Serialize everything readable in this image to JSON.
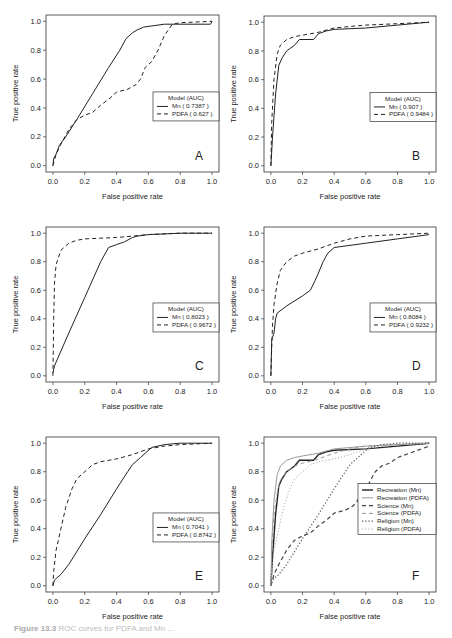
{
  "figure": {
    "caption_label": "Figure 13.3",
    "caption_text": "ROC curves for PDFA and Mn ..."
  },
  "chart_data": [
    {
      "panel": "A",
      "type": "line",
      "xlabel": "False positive rate",
      "ylabel": "True positive rate",
      "xlim": [
        0,
        1
      ],
      "ylim": [
        0,
        1
      ],
      "xticks": [
        "0.0",
        "0.2",
        "0.4",
        "0.6",
        "0.8",
        "1.0"
      ],
      "yticks": [
        "0.0",
        "0.2",
        "0.4",
        "0.6",
        "0.8",
        "1.0"
      ],
      "grid": false,
      "legend": {
        "title": "Model (AUC)",
        "position": "center-right",
        "entries": [
          "Mn ( 0.7387 )",
          "PDFA ( 0.627 )"
        ]
      },
      "series": [
        {
          "name": "Mn",
          "auc": 0.7387,
          "style": "solid",
          "x": [
            0,
            0.005,
            0.02,
            0.04,
            0.08,
            0.15,
            0.25,
            0.35,
            0.42,
            0.46,
            0.5,
            0.53,
            0.57,
            0.7,
            0.99,
            1.0
          ],
          "y": [
            0,
            0.05,
            0.08,
            0.14,
            0.2,
            0.32,
            0.5,
            0.68,
            0.8,
            0.88,
            0.92,
            0.94,
            0.96,
            0.98,
            0.98,
            1.0
          ]
        },
        {
          "name": "PDFA",
          "auc": 0.627,
          "style": "dashed",
          "x": [
            0,
            0.02,
            0.05,
            0.1,
            0.15,
            0.2,
            0.25,
            0.3,
            0.35,
            0.4,
            0.47,
            0.52,
            0.55,
            0.58,
            0.62,
            0.66,
            0.7,
            0.75,
            0.8,
            1.0
          ],
          "y": [
            0,
            0.08,
            0.15,
            0.25,
            0.32,
            0.35,
            0.37,
            0.42,
            0.46,
            0.51,
            0.53,
            0.56,
            0.6,
            0.68,
            0.72,
            0.8,
            0.9,
            0.98,
            0.99,
            1.0
          ]
        }
      ]
    },
    {
      "panel": "B",
      "type": "line",
      "xlabel": "False positive rate",
      "ylabel": "True positive rate",
      "xlim": [
        0,
        1
      ],
      "ylim": [
        0,
        1
      ],
      "xticks": [
        "0.0",
        "0.2",
        "0.4",
        "0.6",
        "0.8",
        "1.0"
      ],
      "yticks": [
        "0.0",
        "0.2",
        "0.4",
        "0.6",
        "0.8",
        "1.0"
      ],
      "grid": false,
      "legend": {
        "title": "Model (AUC)",
        "position": "center-right",
        "entries": [
          "Mn ( 0.907 )",
          "PDFA ( 0.9484 )"
        ]
      },
      "series": [
        {
          "name": "Mn",
          "auc": 0.907,
          "style": "solid",
          "x": [
            0,
            0.01,
            0.03,
            0.05,
            0.07,
            0.1,
            0.15,
            0.18,
            0.27,
            0.3,
            0.35,
            0.4,
            0.6,
            0.8,
            1.0
          ],
          "y": [
            0,
            0.2,
            0.5,
            0.7,
            0.75,
            0.8,
            0.84,
            0.88,
            0.88,
            0.92,
            0.94,
            0.95,
            0.96,
            0.98,
            1.0
          ]
        },
        {
          "name": "PDFA",
          "auc": 0.9484,
          "style": "dashed",
          "x": [
            0,
            0.005,
            0.02,
            0.04,
            0.06,
            0.1,
            0.15,
            0.2,
            0.3,
            0.4,
            0.5,
            0.6,
            0.8,
            1.0
          ],
          "y": [
            0,
            0.3,
            0.6,
            0.78,
            0.84,
            0.88,
            0.9,
            0.91,
            0.93,
            0.96,
            0.97,
            0.98,
            0.99,
            1.0
          ]
        }
      ]
    },
    {
      "panel": "C",
      "type": "line",
      "xlabel": "False positive rate",
      "ylabel": "True positive rate",
      "xlim": [
        0,
        1
      ],
      "ylim": [
        0,
        1
      ],
      "xticks": [
        "0.0",
        "0.2",
        "0.4",
        "0.6",
        "0.8",
        "1.0"
      ],
      "yticks": [
        "0.0",
        "0.2",
        "0.4",
        "0.6",
        "0.8",
        "1.0"
      ],
      "grid": false,
      "legend": {
        "title": "Model (AUC)",
        "position": "center-right",
        "entries": [
          "Mn ( 0.8023 )",
          "PDFA ( 0.9672 )"
        ]
      },
      "series": [
        {
          "name": "Mn",
          "auc": 0.8023,
          "style": "solid",
          "x": [
            0,
            0.01,
            0.1,
            0.2,
            0.3,
            0.35,
            0.4,
            0.45,
            0.5,
            0.53,
            0.6,
            0.7,
            0.8,
            1.0
          ],
          "y": [
            0.02,
            0.07,
            0.3,
            0.55,
            0.8,
            0.9,
            0.92,
            0.94,
            0.97,
            0.98,
            0.99,
            0.995,
            1.0,
            1.0
          ]
        },
        {
          "name": "PDFA",
          "auc": 0.9672,
          "style": "dashed",
          "x": [
            0,
            0.005,
            0.01,
            0.02,
            0.05,
            0.1,
            0.15,
            0.2,
            0.3,
            0.4,
            0.5,
            0.6,
            0.8,
            1.0
          ],
          "y": [
            0,
            0.4,
            0.65,
            0.78,
            0.88,
            0.93,
            0.95,
            0.96,
            0.965,
            0.97,
            0.98,
            0.99,
            1.0,
            1.0
          ]
        }
      ]
    },
    {
      "panel": "D",
      "type": "line",
      "xlabel": "False positive rate",
      "ylabel": "True positive rate",
      "xlim": [
        0,
        1
      ],
      "ylim": [
        0,
        1
      ],
      "xticks": [
        "0.0",
        "0.2",
        "0.4",
        "0.6",
        "0.8",
        "1.0"
      ],
      "yticks": [
        "0.0",
        "0.2",
        "0.4",
        "0.6",
        "0.8",
        "1.0"
      ],
      "grid": false,
      "legend": {
        "title": "Model (AUC)",
        "position": "center-right",
        "entries": [
          "Mn ( 0.8084 )",
          "PDFA ( 0.9232 )"
        ]
      },
      "series": [
        {
          "name": "Mn",
          "auc": 0.8084,
          "style": "solid",
          "x": [
            0,
            0.005,
            0.01,
            0.02,
            0.03,
            0.04,
            0.1,
            0.2,
            0.25,
            0.28,
            0.3,
            0.33,
            0.36,
            0.4,
            0.6,
            0.8,
            1.0
          ],
          "y": [
            0,
            0.25,
            0.27,
            0.3,
            0.4,
            0.44,
            0.49,
            0.56,
            0.6,
            0.67,
            0.72,
            0.8,
            0.86,
            0.9,
            0.93,
            0.96,
            0.99
          ]
        },
        {
          "name": "PDFA",
          "auc": 0.9232,
          "style": "dashed",
          "x": [
            0,
            0.005,
            0.01,
            0.02,
            0.04,
            0.06,
            0.1,
            0.15,
            0.2,
            0.3,
            0.4,
            0.5,
            0.6,
            0.8,
            1.0
          ],
          "y": [
            0,
            0.2,
            0.35,
            0.5,
            0.65,
            0.74,
            0.8,
            0.84,
            0.86,
            0.89,
            0.93,
            0.96,
            0.98,
            0.99,
            1.0
          ]
        }
      ]
    },
    {
      "panel": "E",
      "type": "line",
      "xlabel": "False positive rate",
      "ylabel": "True positive rate",
      "xlim": [
        0,
        1
      ],
      "ylim": [
        0,
        1
      ],
      "xticks": [
        "0.0",
        "0.2",
        "0.4",
        "0.6",
        "0.8",
        "1.0"
      ],
      "yticks": [
        "0.0",
        "0.2",
        "0.4",
        "0.6",
        "0.8",
        "1.0"
      ],
      "grid": false,
      "legend": {
        "title": "Model (AUC)",
        "position": "center-right",
        "entries": [
          "Mn ( 0.7041 )",
          "PDFA ( 0.8742 )"
        ]
      },
      "series": [
        {
          "name": "Mn",
          "auc": 0.7041,
          "style": "solid",
          "x": [
            0,
            0.01,
            0.03,
            0.05,
            0.1,
            0.2,
            0.3,
            0.4,
            0.47,
            0.5,
            0.55,
            0.58,
            0.62,
            0.7,
            0.8,
            1.0
          ],
          "y": [
            0,
            0.04,
            0.06,
            0.08,
            0.15,
            0.33,
            0.5,
            0.68,
            0.8,
            0.85,
            0.9,
            0.93,
            0.97,
            0.99,
            1.0,
            1.0
          ]
        },
        {
          "name": "PDFA",
          "auc": 0.8742,
          "style": "dashed",
          "x": [
            0,
            0.005,
            0.02,
            0.05,
            0.08,
            0.12,
            0.15,
            0.2,
            0.25,
            0.3,
            0.4,
            0.5,
            0.6,
            0.7,
            0.8,
            1.0
          ],
          "y": [
            0,
            0.1,
            0.25,
            0.4,
            0.55,
            0.68,
            0.75,
            0.8,
            0.85,
            0.87,
            0.89,
            0.92,
            0.96,
            0.98,
            0.99,
            1.0
          ]
        }
      ]
    },
    {
      "panel": "F",
      "type": "line",
      "xlabel": "False positive rate",
      "ylabel": "True positive rate",
      "xlim": [
        0,
        1
      ],
      "ylim": [
        0,
        1
      ],
      "xticks": [
        "0.0",
        "0.2",
        "0.4",
        "0.6",
        "0.8",
        "1.0"
      ],
      "yticks": [
        "0.0",
        "0.2",
        "0.4",
        "0.6",
        "0.8",
        "1.0"
      ],
      "grid": false,
      "legend": {
        "title": "",
        "position": "center-right",
        "entries": [
          "Recreation (Mn)",
          "Recreation (PDFA)",
          "Science (Mn)",
          "Science (PDFA)",
          "Religion (Mn)",
          "Religion (PDFA)"
        ]
      },
      "series": [
        {
          "name": "Recreation (Mn)",
          "style": "solid",
          "color": "#222222",
          "width": 1.4,
          "x": [
            0,
            0.01,
            0.03,
            0.05,
            0.07,
            0.1,
            0.15,
            0.18,
            0.27,
            0.3,
            0.35,
            0.4,
            0.6,
            0.8,
            1.0
          ],
          "y": [
            0,
            0.2,
            0.5,
            0.7,
            0.75,
            0.8,
            0.84,
            0.88,
            0.88,
            0.92,
            0.94,
            0.95,
            0.96,
            0.98,
            1.0
          ]
        },
        {
          "name": "Recreation (PDFA)",
          "style": "solid",
          "color": "#999999",
          "width": 1.0,
          "x": [
            0,
            0.005,
            0.02,
            0.04,
            0.06,
            0.1,
            0.15,
            0.2,
            0.3,
            0.4,
            0.5,
            0.6,
            0.8,
            1.0
          ],
          "y": [
            0,
            0.3,
            0.6,
            0.78,
            0.84,
            0.88,
            0.9,
            0.91,
            0.93,
            0.96,
            0.97,
            0.98,
            0.99,
            1.0
          ]
        },
        {
          "name": "Science (Mn)",
          "style": "dashed",
          "color": "#444444",
          "width": 1.2,
          "x": [
            0,
            0.02,
            0.05,
            0.1,
            0.15,
            0.2,
            0.25,
            0.3,
            0.35,
            0.4,
            0.47,
            0.52,
            0.55,
            0.58,
            0.62,
            0.66,
            0.7,
            0.75,
            0.8,
            1.0
          ],
          "y": [
            0,
            0.08,
            0.15,
            0.25,
            0.32,
            0.35,
            0.37,
            0.42,
            0.46,
            0.51,
            0.53,
            0.56,
            0.6,
            0.68,
            0.72,
            0.8,
            0.84,
            0.86,
            0.9,
            0.98
          ]
        },
        {
          "name": "Science (PDFA)",
          "style": "dashed",
          "color": "#999999",
          "width": 1.0,
          "x": [
            0,
            0.005,
            0.01,
            0.02,
            0.04,
            0.06,
            0.1,
            0.15,
            0.2,
            0.3,
            0.4,
            0.5,
            0.6,
            0.8,
            1.0
          ],
          "y": [
            0,
            0.2,
            0.35,
            0.5,
            0.65,
            0.74,
            0.8,
            0.84,
            0.86,
            0.89,
            0.93,
            0.96,
            0.98,
            0.99,
            1.0
          ]
        },
        {
          "name": "Religion (Mn)",
          "style": "dotted",
          "color": "#555555",
          "width": 1.2,
          "x": [
            0,
            0.01,
            0.03,
            0.05,
            0.1,
            0.2,
            0.3,
            0.4,
            0.47,
            0.5,
            0.55,
            0.58,
            0.62,
            0.7,
            0.8,
            1.0
          ],
          "y": [
            0,
            0.04,
            0.06,
            0.08,
            0.15,
            0.33,
            0.5,
            0.68,
            0.8,
            0.85,
            0.9,
            0.93,
            0.97,
            0.99,
            1.0,
            1.0
          ]
        },
        {
          "name": "Religion (PDFA)",
          "style": "dotted",
          "color": "#aaaaaa",
          "width": 1.0,
          "x": [
            0,
            0.005,
            0.02,
            0.05,
            0.08,
            0.12,
            0.15,
            0.2,
            0.25,
            0.3,
            0.4,
            0.5,
            0.6,
            0.7,
            0.8,
            1.0
          ],
          "y": [
            0,
            0.1,
            0.25,
            0.4,
            0.55,
            0.68,
            0.75,
            0.8,
            0.85,
            0.87,
            0.89,
            0.92,
            0.96,
            0.98,
            0.99,
            1.0
          ]
        }
      ]
    }
  ],
  "layout": {
    "panels": [
      {
        "panel": "A",
        "box": [
          46,
          15,
          219,
          172
        ]
      },
      {
        "panel": "B",
        "box": [
          264,
          16,
          436,
          172
        ]
      },
      {
        "panel": "C",
        "box": [
          46,
          227,
          219,
          382
        ]
      },
      {
        "panel": "D",
        "box": [
          264,
          227,
          436,
          382
        ]
      },
      {
        "panel": "E",
        "box": [
          46,
          437,
          219,
          592
        ]
      },
      {
        "panel": "F",
        "box": [
          264,
          437,
          436,
          592
        ]
      }
    ]
  }
}
